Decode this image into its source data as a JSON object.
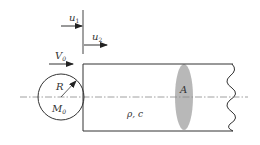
{
  "diagram": {
    "labels": {
      "u1": "u",
      "u1_sub": "1",
      "u2": "u",
      "u2_sub": "2",
      "V0": "V",
      "V0_sub": "0",
      "R": "R",
      "M0": "M",
      "M0_sub": "0",
      "rho_c": "ρ, c",
      "A": "A"
    },
    "colors": {
      "stroke": "#333333",
      "cross_section_fill": "#b8b8b8",
      "centerline": "#888888"
    }
  }
}
